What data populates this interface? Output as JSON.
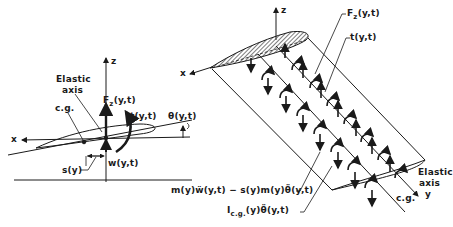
{
  "left_view": {
    "axis_z": "z",
    "axis_x": "x",
    "elastic_axis_line1": "Elastic",
    "elastic_axis_line2": "axis",
    "cg": "c.g.",
    "force": {
      "main": "F",
      "sub": "z",
      "args": "(y,t)"
    },
    "torque": "t(y,t)",
    "twist": "θ(y,t)",
    "offset": "s(y)",
    "deflection": "w(y,t)"
  },
  "right_view": {
    "axis_z": "z",
    "axis_x": "x",
    "axis_y": "y",
    "force": {
      "main": "F",
      "sub": "z",
      "args": "(y,t)"
    },
    "torque": "t(y,t)",
    "inertia_force": "m(y)ẅ(y,t) − s(y)m(y)θ̈(y,t)",
    "inertia_moment": {
      "main": "I",
      "sub": "c.g.",
      "args": "(y)θ̈(y,t)"
    },
    "elastic_axis_line1": "Elastic",
    "elastic_axis_line2": "axis",
    "cg": "c.g."
  },
  "colors": {
    "ink": "#1a1a1a",
    "hatch": "#555555"
  }
}
